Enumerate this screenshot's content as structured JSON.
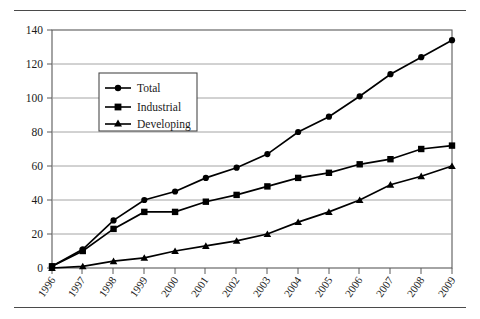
{
  "chart_data": {
    "type": "line",
    "title": "",
    "subtitle": "",
    "xlabel": "",
    "ylabel": "",
    "categories": [
      "1996",
      "1997",
      "1998",
      "1999",
      "2000",
      "2001",
      "2002",
      "2003",
      "2004",
      "2005",
      "2006",
      "2007",
      "2008",
      "2009"
    ],
    "x": [
      1996,
      1997,
      1998,
      1999,
      2000,
      2001,
      2002,
      2003,
      2004,
      2005,
      2006,
      2007,
      2008,
      2009
    ],
    "series": [
      {
        "name": "Total",
        "marker": "circle",
        "values": [
          1,
          11,
          28,
          40,
          45,
          53,
          59,
          67,
          80,
          89,
          101,
          114,
          124,
          134
        ]
      },
      {
        "name": "Industrial",
        "marker": "square",
        "values": [
          1,
          10,
          23,
          33,
          33,
          39,
          43,
          48,
          53,
          56,
          61,
          64,
          70,
          72
        ]
      },
      {
        "name": "Developing",
        "marker": "triangle",
        "values": [
          0,
          1,
          4,
          6,
          10,
          13,
          16,
          20,
          27,
          33,
          40,
          49,
          54,
          60
        ]
      }
    ],
    "ylim": [
      0,
      140
    ],
    "yticks": [
      0,
      20,
      40,
      60,
      80,
      100,
      120,
      140
    ],
    "ytick_labels": [
      "0",
      "20",
      "40",
      "60",
      "80",
      "100",
      "120",
      "140"
    ],
    "grid": true,
    "grid_axis": "y",
    "legend_position": "upper-left-inside",
    "legend_entries": [
      "Total",
      "Industrial",
      "Developing"
    ],
    "colors": {
      "series_line": "#000000",
      "grid": "#9a9a9a",
      "axis": "#5a5a5a",
      "background": "#ffffff"
    }
  },
  "legend": {
    "items": [
      {
        "label": "Total",
        "marker": "circle-marker-icon"
      },
      {
        "label": "Industrial",
        "marker": "square-marker-icon"
      },
      {
        "label": "Developing",
        "marker": "triangle-marker-icon"
      }
    ]
  },
  "axes": {
    "y_labels": [
      "140",
      "120",
      "100",
      "80",
      "60",
      "40",
      "20",
      "0"
    ],
    "x_labels": [
      "1996",
      "1997",
      "1998",
      "1999",
      "2000",
      "2001",
      "2002",
      "2003",
      "2004",
      "2005",
      "2006",
      "2007",
      "2008",
      "2009"
    ]
  }
}
